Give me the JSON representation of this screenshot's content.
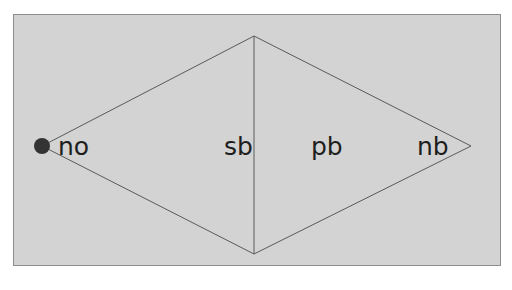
{
  "diagram": {
    "type": "rhombus-with-vertical-divider",
    "colors": {
      "background": "#d3d3d3",
      "border": "#8e8e8e",
      "lines": "#5a5a5a",
      "node_dot": "#333333",
      "text": "#1e1e1e"
    },
    "vertices": {
      "left": {
        "x": 42,
        "y": 146
      },
      "top": {
        "x": 254,
        "y": 36
      },
      "right": {
        "x": 471,
        "y": 146
      },
      "bottom": {
        "x": 254,
        "y": 254
      }
    },
    "divider": {
      "x": 254,
      "y1": 36,
      "y2": 254
    },
    "dot": {
      "cx": 42,
      "cy": 146,
      "r": 8
    },
    "labels": [
      {
        "id": "no",
        "text": "no",
        "x": 58,
        "y": 155
      },
      {
        "id": "sb",
        "text": "sb",
        "x": 224,
        "y": 155
      },
      {
        "id": "pb",
        "text": "pb",
        "x": 311,
        "y": 155
      },
      {
        "id": "nb",
        "text": "nb",
        "x": 417,
        "y": 155
      }
    ]
  }
}
